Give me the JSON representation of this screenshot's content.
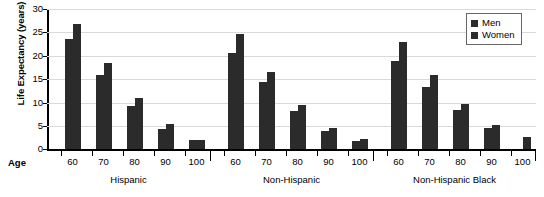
{
  "chart_data": {
    "type": "bar",
    "title": "",
    "xlabel": "Age",
    "ylabel": "Life Expectancy (years)",
    "ylim": [
      0,
      30
    ],
    "yticks": [
      0,
      5,
      10,
      15,
      20,
      25,
      30
    ],
    "grid": true,
    "legend_position": "top-right",
    "legend": [
      "Men",
      "Women"
    ],
    "group_label_row": [
      "Hispanic",
      "Non-Hispanic",
      "Non-Hispanic Black"
    ],
    "categories": [
      "60",
      "70",
      "80",
      "90",
      "100"
    ],
    "groups": [
      {
        "name": "Hispanic",
        "ages": [
          "60",
          "70",
          "80",
          "90",
          "100"
        ],
        "series": [
          {
            "name": "Men",
            "values": [
              23.5,
              16.0,
              9.3,
              4.3,
              2.1
            ]
          },
          {
            "name": "Women",
            "values": [
              26.8,
              18.5,
              11.0,
              5.4,
              2.1
            ]
          }
        ]
      },
      {
        "name": "Non-Hispanic",
        "ages": [
          "60",
          "70",
          "80",
          "90",
          "100"
        ],
        "series": [
          {
            "name": "Men",
            "values": [
              20.5,
              14.5,
              8.3,
              4.0,
              1.8
            ]
          },
          {
            "name": "Women",
            "values": [
              24.7,
              16.5,
              9.5,
              4.5,
              2.2
            ]
          }
        ]
      },
      {
        "name": "Non-Hispanic Black",
        "ages": [
          "60",
          "70",
          "80",
          "90",
          "100"
        ],
        "series": [
          {
            "name": "Men",
            "values": [
              19.0,
              13.4,
              8.5,
              4.6,
              0.0
            ]
          },
          {
            "name": "Women",
            "values": [
              23.0,
              16.0,
              9.6,
              5.3,
              2.6
            ]
          }
        ]
      }
    ],
    "colors": {
      "bar": "#2b2b2b",
      "grid": "#d9d9d9",
      "axis": "#000000"
    }
  }
}
